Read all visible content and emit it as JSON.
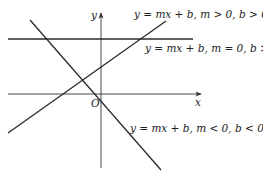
{
  "axes": {
    "x_label": "x",
    "y_label": "y",
    "origin_label": "O"
  },
  "lines": [
    {
      "label": "y = mx + b, m > 0, b > 0"
    },
    {
      "label": "y = mx + b, m = 0, b > 0"
    },
    {
      "label": "y = mx + b, m < 0, b < 0"
    }
  ],
  "colors": {
    "stroke": "#2a2a2a",
    "text": "#222222"
  }
}
